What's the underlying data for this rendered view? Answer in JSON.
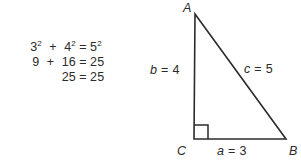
{
  "figure": {
    "background_color": "#ffffff",
    "ink_color": "#2b2b2b"
  },
  "equations": {
    "rows": [
      {
        "lhs_a": "3",
        "lhs_a_sup": "2",
        "op": "+",
        "lhs_b": "4",
        "lhs_b_sup": "2",
        "eq": "=",
        "rhs": "5",
        "rhs_sup": "2"
      },
      {
        "lhs_a": "9",
        "lhs_a_sup": "",
        "op": "+",
        "lhs_b": "16",
        "lhs_b_sup": "",
        "eq": "=",
        "rhs": "25",
        "rhs_sup": ""
      },
      {
        "lhs_a": "",
        "lhs_a_sup": "",
        "op": "",
        "lhs_b": "25",
        "lhs_b_sup": "",
        "eq": "=",
        "rhs": "25",
        "rhs_sup": ""
      }
    ],
    "line1_text": "3² + 4² = 5²",
    "line2_text": "9 + 16 = 25",
    "line3_text": "25 = 25"
  },
  "triangle": {
    "vertices": {
      "A": {
        "label": "A",
        "x": 45,
        "y": 14
      },
      "B": {
        "label": "B",
        "x": 136,
        "y": 139
      },
      "C": {
        "label": "C",
        "x": 44,
        "y": 139
      }
    },
    "sides": [
      {
        "name": "a",
        "variable": "a",
        "equals": "=",
        "value": "3",
        "text": "a = 3",
        "position": "bottom"
      },
      {
        "name": "b",
        "variable": "b",
        "equals": "=",
        "value": "4",
        "text": "b = 4",
        "position": "left"
      },
      {
        "name": "c",
        "variable": "c",
        "equals": "=",
        "value": "5",
        "text": "c = 5",
        "position": "hypotenuse"
      }
    ],
    "right_angle_marker": {
      "at_vertex": "C",
      "size": 14
    },
    "stroke_color": "#2b2b2b",
    "stroke_width": 1.6
  }
}
